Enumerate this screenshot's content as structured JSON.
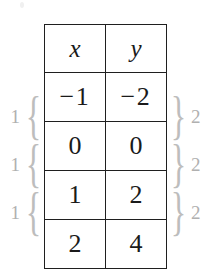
{
  "figure": {
    "type": "table-of-values-with-difference-braces",
    "table": {
      "headers": [
        "x",
        "y"
      ],
      "rows": [
        [
          "−1",
          "−2"
        ],
        [
          "0",
          "0"
        ],
        [
          "1",
          "2"
        ],
        [
          "2",
          "4"
        ]
      ]
    },
    "left_annotations": [
      {
        "label": "1",
        "brace": "{"
      },
      {
        "label": "1",
        "brace": "{"
      },
      {
        "label": "1",
        "brace": "{"
      }
    ],
    "right_annotations": [
      {
        "brace": "}",
        "label": "2"
      },
      {
        "brace": "}",
        "label": "2"
      },
      {
        "brace": "}",
        "label": "2"
      }
    ],
    "colors": {
      "table_line": "#1f1f1f",
      "table_text": "#1a1a1a",
      "annotation": "#b9b9b9",
      "background": "#ffffff"
    }
  }
}
